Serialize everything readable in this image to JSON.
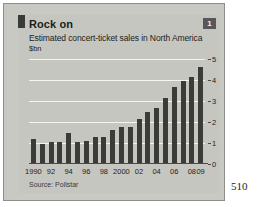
{
  "page": {
    "page_number": "510"
  },
  "chart_panel": {
    "badge": "1",
    "title": "Rock on",
    "subtitle": "Estimated concert-ticket sales in North America",
    "units": "$bn",
    "source": "Source: Pollstar",
    "accent_color": "#3b3b39",
    "panel_background": "#c6c6c1",
    "gridline_color": "#f4f4f0"
  },
  "chart_data": {
    "type": "bar",
    "title": "Rock on",
    "subtitle": "Estimated concert-ticket sales in North America",
    "xlabel": "",
    "ylabel": "$bn",
    "ylim": [
      0,
      5
    ],
    "yticks": [
      0,
      1,
      2,
      3,
      4,
      5
    ],
    "ytick_labels": [
      "0",
      "1",
      "2",
      "3",
      "4",
      "5"
    ],
    "y_axis_position": "right",
    "grid": true,
    "legend": false,
    "source": "Source: Pollstar",
    "categories": [
      "1990",
      "1991",
      "1992",
      "1993",
      "1994",
      "1995",
      "1996",
      "1997",
      "1998",
      "1999",
      "2000",
      "2001",
      "2002",
      "2003",
      "2004",
      "2005",
      "2006",
      "2007",
      "2008",
      "2009"
    ],
    "xtick_labels": [
      "1990",
      "92",
      "94",
      "96",
      "98",
      "2000",
      "02",
      "04",
      "06",
      "08",
      "09"
    ],
    "xtick_categories": [
      "1990",
      "1992",
      "1994",
      "1996",
      "1998",
      "2000",
      "2002",
      "2004",
      "2006",
      "2008",
      "2009"
    ],
    "values": [
      1.2,
      0.95,
      1.05,
      1.05,
      1.5,
      1.05,
      1.1,
      1.3,
      1.3,
      1.6,
      1.75,
      1.75,
      2.15,
      2.5,
      2.65,
      3.15,
      3.65,
      3.95,
      4.15,
      4.6
    ]
  }
}
